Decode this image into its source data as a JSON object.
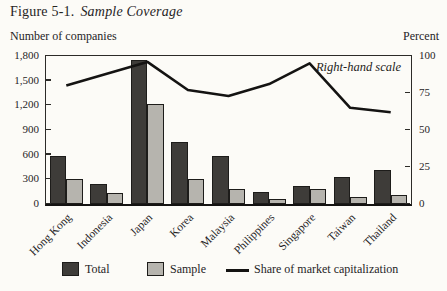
{
  "figure": {
    "label": "Figure 5-1.",
    "title": "Sample Coverage"
  },
  "axes": {
    "left_title": "Number of companies",
    "right_title": "Percent"
  },
  "annotation": "Right-hand scale",
  "legend": {
    "total_label": "Total",
    "sample_label": "Sample",
    "line_label": "Share of market capitalization"
  },
  "colors": {
    "total_bar": "#3e3c39",
    "sample_bar": "#b6b4ae",
    "line": "#141312",
    "background": "#fcfbf7",
    "axis": "#2c2b28"
  },
  "chart_data": {
    "type": "bar",
    "subtype": "grouped bars with overlay line",
    "categories": [
      "Hong Kong",
      "Indonesia",
      "Japan",
      "Korea",
      "Malaysia",
      "Philippines",
      "Singapore",
      "Taiwan",
      "Thailand"
    ],
    "series": [
      {
        "name": "Total",
        "type": "bar",
        "axis": "left",
        "values": [
          590,
          240,
          1750,
          750,
          580,
          150,
          220,
          330,
          420
        ]
      },
      {
        "name": "Sample",
        "type": "bar",
        "axis": "left",
        "values": [
          300,
          140,
          1220,
          300,
          180,
          60,
          180,
          80,
          110
        ]
      },
      {
        "name": "Share of market capitalization",
        "type": "line",
        "axis": "right",
        "values": [
          80,
          88,
          96,
          77,
          73,
          81,
          95,
          65,
          62
        ]
      }
    ],
    "left_axis": {
      "label": "Number of companies",
      "range": [
        0,
        1800
      ],
      "tick_labels": [
        "1,800",
        "1,500",
        "1,200",
        "900",
        "600",
        "300",
        "0"
      ],
      "tick_values": [
        1800,
        1500,
        1200,
        900,
        600,
        300,
        0
      ]
    },
    "right_axis": {
      "label": "Percent",
      "range": [
        0,
        100
      ],
      "tick_labels": [
        "100",
        "75",
        "50",
        "25",
        "0"
      ],
      "tick_values": [
        100,
        75,
        50,
        25,
        0
      ]
    },
    "grid": false,
    "legend_position": "bottom"
  }
}
